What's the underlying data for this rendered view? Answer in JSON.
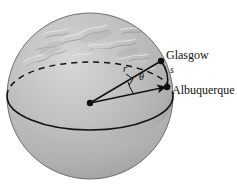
{
  "figure": {
    "background_color": "#ffffff"
  },
  "sphere": {
    "name": "earth-globe",
    "center_x": 90,
    "center_y": 96,
    "radius": 83,
    "fill_light": "#c9c9c9",
    "fill_mid": "#b4b4b4",
    "fill_shadow": "#9a9a9a",
    "outline_color": "#6b6b6b",
    "textured_hemisphere": "northern",
    "plain_hemisphere": "southern"
  },
  "great_circle": {
    "name": "equatorial-great-circle",
    "back_half_style": "dashed",
    "front_half_style": "solid",
    "stroke_color": "#111111"
  },
  "points": [
    {
      "id": "center",
      "label": "",
      "x": 90,
      "y": 103,
      "dot_radius": 3.2
    },
    {
      "id": "glasgow",
      "label": "Glasgow",
      "x": 161,
      "y": 61,
      "dot_radius": 3.2
    },
    {
      "id": "albuquerque",
      "label": "Albuquerque",
      "x": 167,
      "y": 87,
      "dot_radius": 3.2
    }
  ],
  "labels": {
    "radius": "r",
    "angle": "θ",
    "arc": "s",
    "glasgow": "Glasgow",
    "albuquerque": "Albuquerque"
  },
  "annotations": {
    "right_angle_marker": true,
    "angle_arc": true,
    "arrow_on_lower_radius": true
  },
  "colors": {
    "line": "#111111",
    "text": "#101010",
    "globe_base": "#bcbcbc"
  }
}
